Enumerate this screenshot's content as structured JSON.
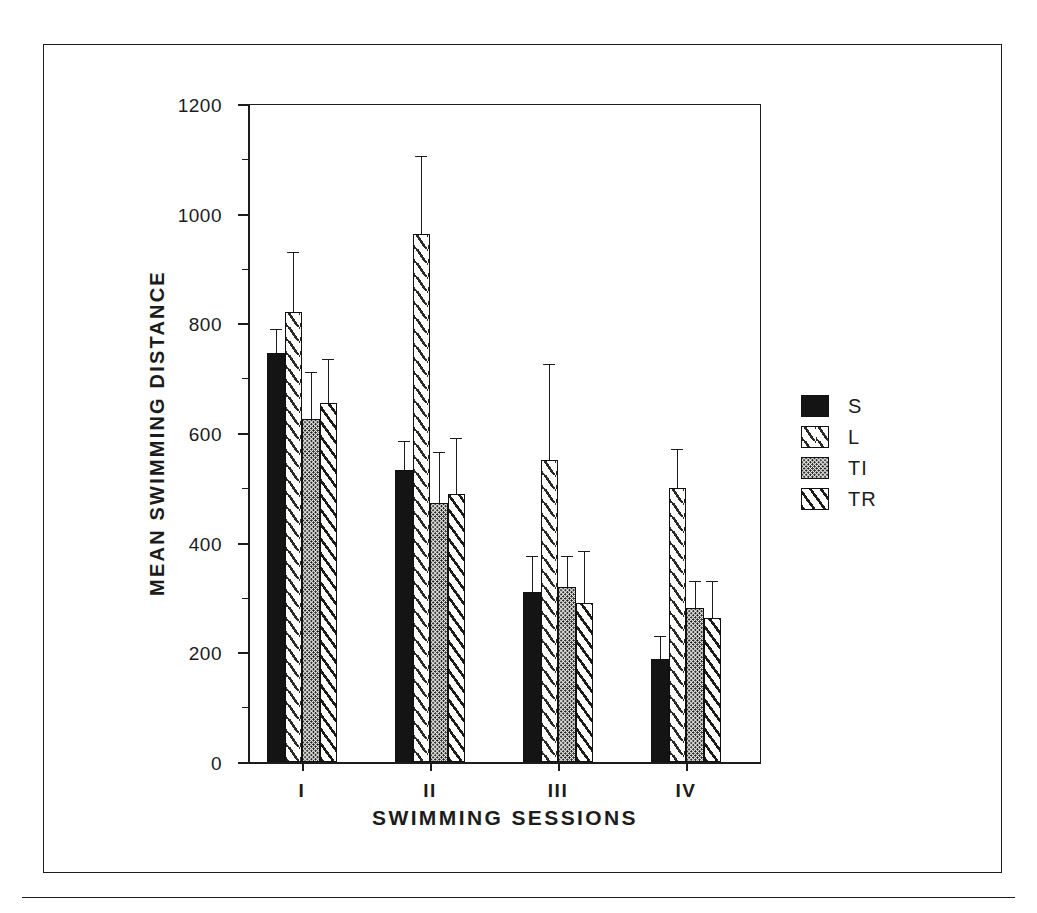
{
  "figure": {
    "ylabel": "MEAN SWIMMING DISTANCE",
    "xlabel": "SWIMMING SESSIONS"
  },
  "legend": {
    "items": [
      {
        "label": "S",
        "pattern": "solid-black"
      },
      {
        "label": "L",
        "pattern": "sparse-diagonal-dash"
      },
      {
        "label": "TI",
        "pattern": "dense-stipple"
      },
      {
        "label": "TR",
        "pattern": "diagonal-hatch"
      }
    ]
  },
  "axes": {
    "y_ticks": [
      "0",
      "200",
      "400",
      "600",
      "800",
      "1000",
      "1200"
    ],
    "x_ticks": [
      "I",
      "II",
      "III",
      "IV"
    ]
  },
  "chart_data": {
    "type": "bar",
    "title": "",
    "xlabel": "SWIMMING SESSIONS",
    "ylabel": "MEAN SWIMMING DISTANCE",
    "categories": [
      "I",
      "II",
      "III",
      "IV"
    ],
    "ylim": [
      0,
      1200
    ],
    "ytick_values": [
      0,
      200,
      400,
      600,
      800,
      1000,
      1200
    ],
    "yminor_step": 100,
    "grid": false,
    "legend_position": "right",
    "error_bar_style": "upper-only-sem",
    "series": [
      {
        "name": "S",
        "values": [
          745,
          533,
          310,
          188
        ],
        "errors_upper": [
          790,
          585,
          375,
          230
        ]
      },
      {
        "name": "L",
        "values": [
          820,
          963,
          550,
          500
        ],
        "errors_upper": [
          930,
          1105,
          725,
          570
        ]
      },
      {
        "name": "TI",
        "values": [
          625,
          473,
          320,
          280
        ],
        "errors_upper": [
          712,
          565,
          375,
          330
        ]
      },
      {
        "name": "TR",
        "values": [
          655,
          488,
          290,
          263
        ],
        "errors_upper": [
          735,
          590,
          385,
          330
        ]
      }
    ]
  }
}
